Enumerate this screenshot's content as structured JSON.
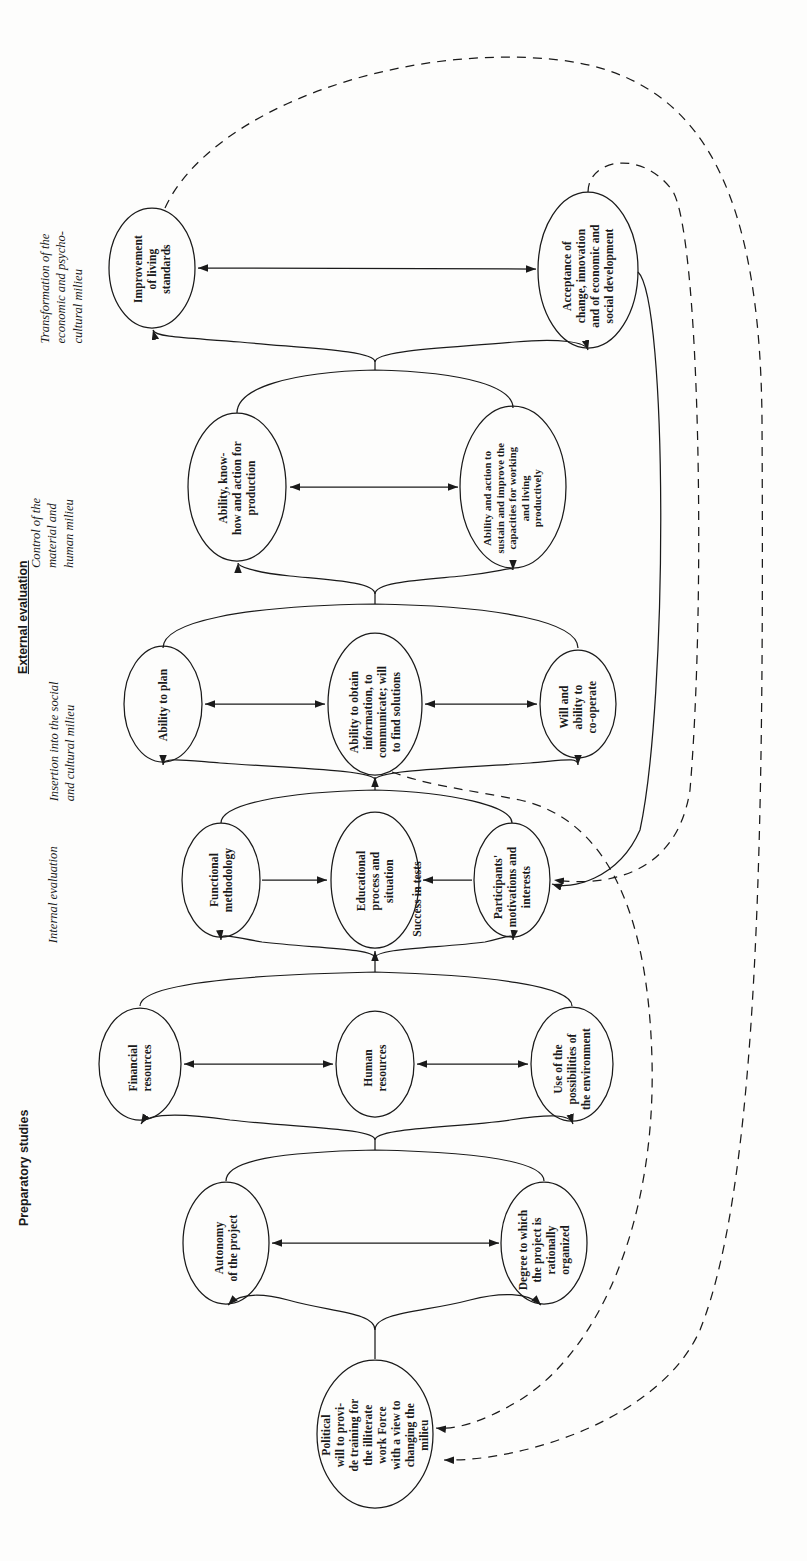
{
  "document": {
    "type": "flowchart-diagram",
    "orientation": "rotated-90-counterclockwise",
    "background_color": "#fdfdfc",
    "ink_color": "#1a1a1a"
  },
  "phases": [
    {
      "id": "external-evaluation",
      "label": "External evaluation",
      "style": "bold-underlined"
    },
    {
      "id": "preparatory-studies",
      "label": "Preparatory studies",
      "style": "bold"
    }
  ],
  "groups": [
    {
      "id": "transformation",
      "label": "Transformation of the\neconomic and psycho-\ncultural milieu"
    },
    {
      "id": "control",
      "label": "Control of the\nmaterial and\nhuman milieu"
    },
    {
      "id": "insertion",
      "label": "Insertion into the social\nand cultural milieu"
    },
    {
      "id": "internal-evaluation",
      "label": "Internal evaluation"
    }
  ],
  "nodes": [
    {
      "id": "improvement-of-living-standards",
      "label": "Improvement\nof living\nstandards",
      "group": "transformation"
    },
    {
      "id": "acceptance-of-change",
      "label": "Acceptance of\nchange, innovation\nand of economic and\nsocial development",
      "group": "transformation"
    },
    {
      "id": "ability-know-how-production",
      "label": "Ability, know-\nhow and action for\nproduction",
      "group": "control"
    },
    {
      "id": "ability-sustain-capacities",
      "label": "Ability and action to\nsustain and improve the\ncapacities for working\nand living\nproductively",
      "group": "control"
    },
    {
      "id": "ability-to-plan",
      "label": "Ability to plan",
      "group": "insertion"
    },
    {
      "id": "ability-to-obtain-information",
      "label": "Ability to obtain\ninformation, to\ncommunicate; will\nto find solutions",
      "group": "insertion"
    },
    {
      "id": "will-ability-to-cooperate",
      "label": "Will and\nability to\nco-operate",
      "group": "insertion"
    },
    {
      "id": "functional-methodology",
      "label": "Functional\nmethodology",
      "group": "internal-evaluation"
    },
    {
      "id": "educational-process",
      "label": "Educational\nprocess and\nsituation",
      "secondary_label": "Success in tests",
      "group": "internal-evaluation"
    },
    {
      "id": "participants-motivations",
      "label": "Participants'\nmotivations and\ninterests",
      "group": "internal-evaluation"
    },
    {
      "id": "financial-resources",
      "label": "Financial\nresources",
      "group": "preparatory-studies"
    },
    {
      "id": "human-resources",
      "label": "Human\nresources",
      "group": "preparatory-studies"
    },
    {
      "id": "use-of-possibilities",
      "label": "Use of the\npossibilities of\nthe environment",
      "group": "preparatory-studies"
    },
    {
      "id": "autonomy-of-the-project",
      "label": "Autonomy\nof the project",
      "group": "preparatory-studies"
    },
    {
      "id": "degree-rationally-organized",
      "label": "Degree to which\nthe project is\nrationally\norganized",
      "group": "preparatory-studies"
    },
    {
      "id": "political-will",
      "label": "Political\nwill to provi-\nde training for\nthe illiterate\nwork Force\nwith a view to\nchanging the\nmilieu",
      "group": "preparatory-studies"
    }
  ],
  "edges": [
    {
      "from": "improvement-of-living-standards",
      "to": "acceptance-of-change",
      "style": "solid",
      "arrows": "both"
    },
    {
      "from": "ability-know-how-production",
      "to": "ability-sustain-capacities",
      "style": "solid",
      "arrows": "both"
    },
    {
      "from": "ability-to-plan",
      "to": "ability-to-obtain-information",
      "style": "solid",
      "arrows": "both"
    },
    {
      "from": "ability-to-obtain-information",
      "to": "will-ability-to-cooperate",
      "style": "solid",
      "arrows": "both"
    },
    {
      "from": "functional-methodology",
      "to": "educational-process",
      "style": "solid",
      "arrows": "forward"
    },
    {
      "from": "participants-motivations",
      "to": "educational-process",
      "style": "solid",
      "arrows": "forward"
    },
    {
      "from": "financial-resources",
      "to": "human-resources",
      "style": "solid",
      "arrows": "both"
    },
    {
      "from": "human-resources",
      "to": "use-of-possibilities",
      "style": "solid",
      "arrows": "both"
    },
    {
      "from": "autonomy-of-the-project",
      "to": "degree-rationally-organized",
      "style": "solid",
      "arrows": "both"
    },
    {
      "from": "political-will",
      "to": "project-stage",
      "style": "solid",
      "arrows": "forward"
    },
    {
      "from": "project-stage",
      "to": "resources-stage",
      "style": "solid",
      "arrows": "forward"
    },
    {
      "from": "resources-stage",
      "to": "internal-evaluation-stage",
      "style": "solid",
      "arrows": "forward"
    },
    {
      "from": "internal-evaluation-stage",
      "to": "insertion-stage",
      "style": "solid",
      "arrows": "forward"
    },
    {
      "from": "insertion-stage",
      "to": "control-stage",
      "style": "solid",
      "arrows": "forward"
    },
    {
      "from": "control-stage",
      "to": "transformation-stage",
      "style": "solid",
      "arrows": "forward"
    },
    {
      "from": "acceptance-of-change",
      "to": "participants-motivations",
      "style": "solid",
      "arrows": "forward"
    },
    {
      "from": "transformation-stage",
      "to": "participants-motivations",
      "style": "dashed",
      "arrows": "forward"
    },
    {
      "from": "transformation-stage",
      "to": "political-will",
      "style": "dashed",
      "arrows": "forward"
    },
    {
      "from": "insertion-stage",
      "to": "political-will",
      "style": "dashed",
      "arrows": "forward"
    }
  ]
}
